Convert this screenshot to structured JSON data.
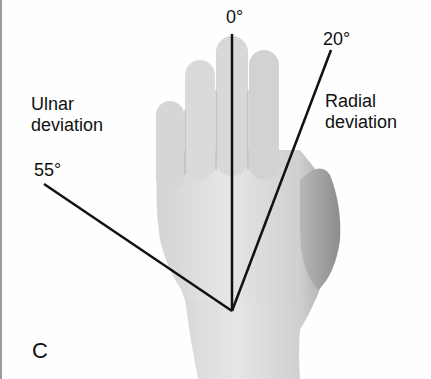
{
  "figure": {
    "panel_letter": "C",
    "axis_labels": {
      "neutral": "0°",
      "radial_angle": "20°",
      "ulnar_angle": "55°"
    },
    "region_labels": {
      "ulnar": "Ulnar\ndeviation",
      "radial": "Radial\ndeviation"
    },
    "lines": {
      "vertex": [
        232,
        311
      ],
      "neutral_end": [
        232,
        34
      ],
      "radial_end": [
        331,
        50
      ],
      "ulnar_end": [
        44,
        184
      ]
    },
    "colors": {
      "background": "#fefefe",
      "line": "#111111",
      "skin_light": "#e4e4e4",
      "skin_mid": "#c9c9c9",
      "skin_dark": "#9e9e9e"
    }
  }
}
